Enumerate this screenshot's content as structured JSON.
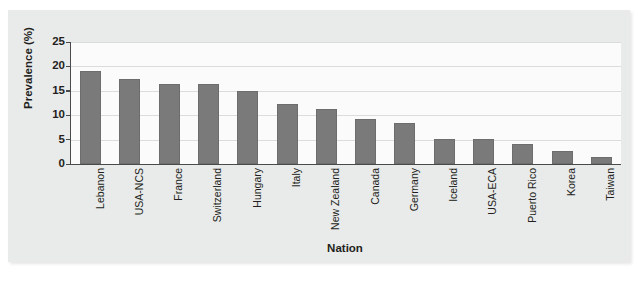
{
  "chart_data": {
    "type": "bar",
    "title": "",
    "xlabel": "Nation",
    "ylabel": "Prevalence (%)",
    "ylim": [
      0,
      25
    ],
    "yticks": [
      0,
      5,
      10,
      15,
      20,
      25
    ],
    "grid": true,
    "legend": "none",
    "bar_color": "#7a7a7a",
    "categories": [
      "Lebanon",
      "USA-NCS",
      "France",
      "Switzerland",
      "Hungary",
      "Italy",
      "New Zealand",
      "Canada",
      "Germany",
      "Iceland",
      "USA-ECA",
      "Puerto Rico",
      "Korea",
      "Taiwan"
    ],
    "values": [
      19.0,
      17.5,
      16.4,
      16.4,
      14.9,
      12.3,
      11.2,
      9.2,
      8.5,
      5.1,
      5.1,
      4.2,
      2.7,
      1.5
    ]
  }
}
